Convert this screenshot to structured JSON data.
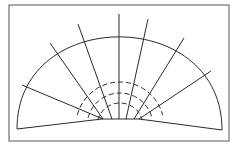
{
  "diagram": {
    "type": "fan-diagram",
    "frame": {
      "x": 9,
      "y": 5,
      "width": 220,
      "height": 136
    },
    "outer_arc": {
      "left": [
        17,
        129
      ],
      "apex": [
        119,
        14
      ],
      "right": [
        222,
        130
      ]
    },
    "base": {
      "left": [
        17,
        129
      ],
      "hub_left": [
        102,
        119
      ],
      "hub_right": [
        139,
        119
      ],
      "right": [
        222,
        130
      ]
    },
    "spokes": [
      {
        "from": [
          103,
          119
        ],
        "to": [
          22,
          85
        ]
      },
      {
        "from": [
          103,
          119
        ],
        "to": [
          50,
          43
        ]
      },
      {
        "from": [
          112,
          119
        ],
        "to": [
          78,
          24
        ]
      },
      {
        "from": [
          119,
          119
        ],
        "to": [
          119,
          14
        ]
      },
      {
        "from": [
          126,
          119
        ],
        "to": [
          148,
          19
        ]
      },
      {
        "from": [
          134,
          119
        ],
        "to": [
          184,
          38
        ]
      },
      {
        "from": [
          139,
          119
        ],
        "to": [
          211,
          71
        ]
      }
    ],
    "dashed_arcs": [
      {
        "cx": 120,
        "cy": 126,
        "r": 44
      },
      {
        "cx": 120,
        "cy": 126,
        "r": 33
      },
      {
        "cx": 120,
        "cy": 126,
        "r": 23
      }
    ],
    "colors": {
      "line": "#2a2a2a",
      "frame": "#555555",
      "background": "#ffffff"
    }
  }
}
